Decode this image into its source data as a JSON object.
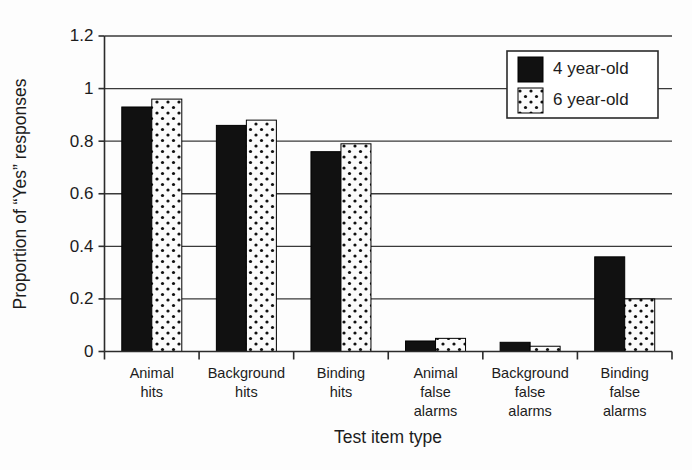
{
  "chart_data": {
    "type": "bar",
    "title": "",
    "xlabel": "Test item type",
    "ylabel": "Proportion of “Yes” responses",
    "categories": [
      "Animal hits",
      "Background hits",
      "Binding hits",
      "Animal false alarms",
      "Background false alarms",
      "Binding false alarms"
    ],
    "category_lines": [
      [
        "Animal",
        "hits"
      ],
      [
        "Background",
        "hits"
      ],
      [
        "Binding",
        "hits"
      ],
      [
        "Animal",
        "false",
        "alarms"
      ],
      [
        "Background",
        "false",
        "alarms"
      ],
      [
        "Binding",
        "false",
        "alarms"
      ]
    ],
    "series": [
      {
        "name": "4 year-old",
        "fill": "solid-black",
        "color": "#111111",
        "values": [
          0.93,
          0.86,
          0.76,
          0.04,
          0.035,
          0.36
        ]
      },
      {
        "name": "6 year-old",
        "fill": "dotted-white",
        "color": "#ffffff",
        "values": [
          0.96,
          0.88,
          0.79,
          0.05,
          0.02,
          0.2
        ]
      }
    ],
    "ylim": [
      0,
      1.2
    ],
    "ytick_values": [
      0,
      0.2,
      0.4,
      0.6,
      0.8,
      1,
      1.2
    ],
    "ytick_labels": [
      "0",
      "0.2",
      "0.4",
      "0.6",
      "0.8",
      "1",
      "1.2"
    ],
    "grid": "horizontal",
    "legend_position": "top-right",
    "legend_entries": [
      "4 year-old",
      "6 year-old"
    ]
  },
  "axes": {
    "y_title": "Proportion of “Yes” responses",
    "x_title": "Test item type"
  },
  "legend": {
    "items": [
      {
        "label": "4 year-old"
      },
      {
        "label": "6 year-old"
      }
    ]
  }
}
